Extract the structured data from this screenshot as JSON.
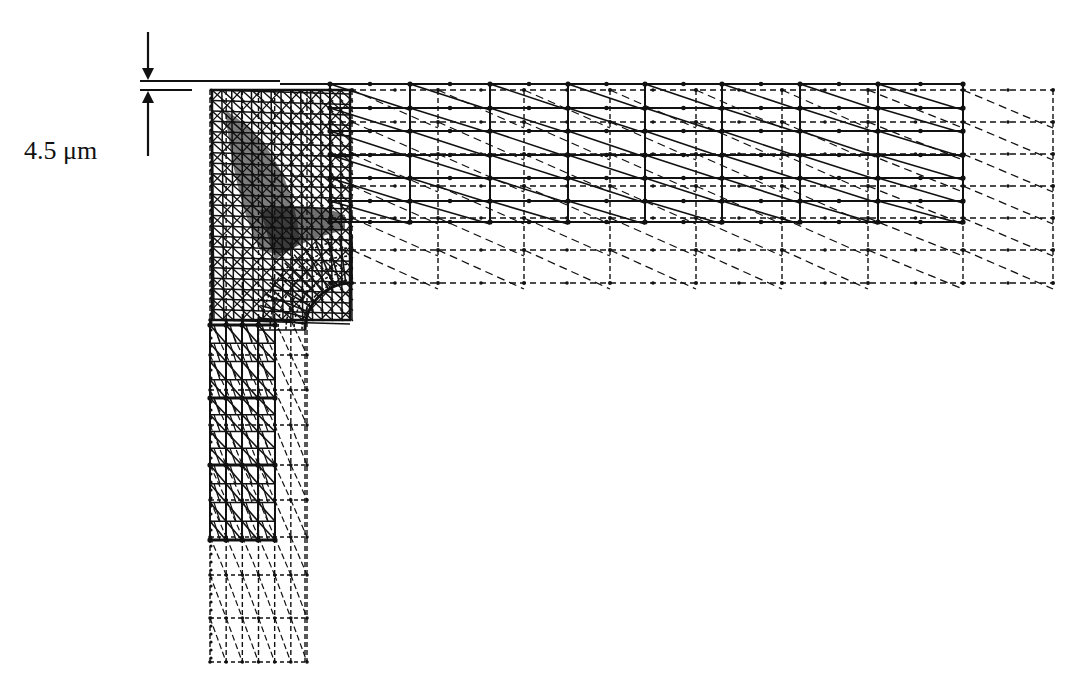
{
  "figure": {
    "dimension_label": "4.5 μm",
    "colors": {
      "ink": "#111111",
      "background": "#ffffff"
    }
  },
  "dimension": {
    "arrow_x": 148,
    "top_line_y": 81,
    "bottom_line_y": 90,
    "arrow_top_start": 32,
    "arrow_bottom_end": 156,
    "top_line_x2": 280,
    "bottom_line_x2": 192
  },
  "mesh": {
    "undeformed": {
      "vertical_arm": {
        "x0": 210,
        "x1": 307,
        "y0": 90,
        "y1": 662,
        "cols": 6,
        "row_ys": [
          320,
          355,
          390,
          425,
          465,
          500,
          537,
          575,
          618,
          662
        ]
      },
      "horizontal_arm": {
        "x0": 330,
        "x1": 1053,
        "y0": 90,
        "y1": 283,
        "row_ys": [
          90,
          122,
          154,
          186,
          218,
          250,
          283
        ],
        "col_xs": [
          330,
          352,
          438,
          524,
          610,
          696,
          782,
          868,
          963,
          1053
        ]
      },
      "fillet": {
        "cx": 352,
        "cy": 330,
        "r": 47
      }
    },
    "deformed": {
      "horizontal_arm": {
        "x0": 330,
        "x1": 963,
        "y0": 84,
        "y1": 222,
        "row_ys": [
          84,
          108,
          131,
          155,
          178,
          201,
          222
        ],
        "col_xs": [
          330,
          410,
          490,
          568,
          645,
          722,
          800,
          878,
          963
        ]
      },
      "vertical_arm": {
        "x0": 210,
        "x1": 275,
        "y0": 320,
        "y1": 540,
        "row_ys": [
          325,
          398,
          465,
          540
        ],
        "col_xs": [
          210,
          226,
          242,
          258,
          275
        ]
      },
      "dense_corner": {
        "x0": 212,
        "x1": 350,
        "y0": 90,
        "y1": 320
      }
    }
  }
}
